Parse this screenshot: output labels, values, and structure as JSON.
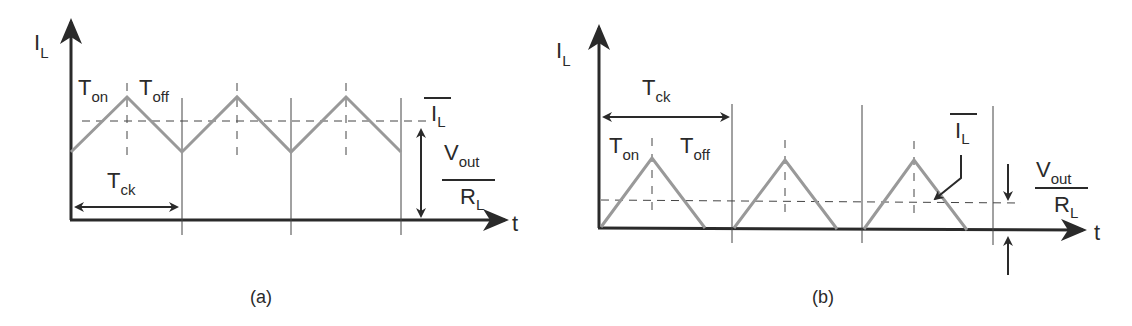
{
  "panels": [
    {
      "id": "a",
      "caption": "(a)",
      "y_axis_label": "I",
      "y_axis_sub": "L",
      "x_axis_label": "t",
      "ton_label": "T",
      "ton_sub": "on",
      "toff_label": "T",
      "toff_sub": "off",
      "tck_label": "T",
      "tck_sub": "ck",
      "mean_label": "I",
      "mean_sub": "L",
      "ratio_num": "V",
      "ratio_num_sub": "out",
      "ratio_den": "R",
      "ratio_den_sub": "L",
      "mode": "continuous conduction"
    },
    {
      "id": "b",
      "caption": "(b)",
      "y_axis_label": "I",
      "y_axis_sub": "L",
      "x_axis_label": "t",
      "ton_label": "T",
      "ton_sub": "on",
      "toff_label": "T",
      "toff_sub": "off",
      "tck_label": "T",
      "tck_sub": "ck",
      "mean_label": "I",
      "mean_sub": "L",
      "ratio_num": "V",
      "ratio_num_sub": "out",
      "ratio_den": "R",
      "ratio_den_sub": "L",
      "mode": "discontinuous conduction"
    }
  ],
  "colors": {
    "axis": "#2a2a2a",
    "waveform": "#999999",
    "grid": "#444444"
  }
}
